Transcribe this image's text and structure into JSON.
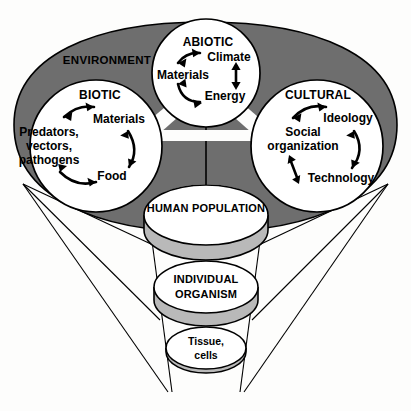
{
  "diagram": {
    "environment_label": "ENVIRONMENT",
    "colors": {
      "ring_fill": "#6e6e6e",
      "circle_fill": "#ffffff",
      "cylinder_top_fill": "#ffffff",
      "cylinder_body_fill": "#b9b9b9",
      "outline": "#000000",
      "background": "#ffffff"
    },
    "sectors": [
      {
        "id": "biotic",
        "title": "BIOTIC",
        "nodes": [
          {
            "id": "biotic-predators",
            "label_line1": "Predators,",
            "label_line2": "vectors,",
            "label_line3": "pathogens"
          },
          {
            "id": "biotic-materials",
            "label_line1": "Materials"
          },
          {
            "id": "biotic-food",
            "label_line1": "Food"
          }
        ],
        "arrows": [
          {
            "from": "biotic-predators",
            "to": "biotic-materials",
            "style": "double-headed-curved"
          },
          {
            "from": "biotic-materials",
            "to": "biotic-food",
            "style": "double-headed-curved"
          },
          {
            "from": "biotic-food",
            "to": "biotic-predators",
            "style": "double-headed-curved"
          }
        ]
      },
      {
        "id": "abiotic",
        "title": "ABIOTIC",
        "nodes": [
          {
            "id": "abiotic-materials",
            "label_line1": "Materials"
          },
          {
            "id": "abiotic-climate",
            "label_line1": "Climate"
          },
          {
            "id": "abiotic-energy",
            "label_line1": "Energy"
          }
        ],
        "arrows": [
          {
            "from": "abiotic-materials",
            "to": "abiotic-climate",
            "style": "double-headed-curved"
          },
          {
            "from": "abiotic-climate",
            "to": "abiotic-energy",
            "style": "double-headed-straight"
          },
          {
            "from": "abiotic-energy",
            "to": "abiotic-materials",
            "style": "double-headed-curved"
          }
        ]
      },
      {
        "id": "cultural",
        "title": "CULTURAL",
        "nodes": [
          {
            "id": "cultural-social",
            "label_line1": "Social",
            "label_line2": "organization"
          },
          {
            "id": "cultural-ideology",
            "label_line1": "Ideology"
          },
          {
            "id": "cultural-technology",
            "label_line1": "Technology"
          }
        ],
        "arrows": [
          {
            "from": "cultural-social",
            "to": "cultural-ideology",
            "style": "double-headed-curved"
          },
          {
            "from": "cultural-ideology",
            "to": "cultural-technology",
            "style": "double-headed-curved"
          },
          {
            "from": "cultural-technology",
            "to": "cultural-social",
            "style": "double-headed-curved"
          }
        ]
      }
    ],
    "levels": [
      {
        "id": "human-population",
        "label_line1": "HUMAN POPULATION",
        "label_line2": ""
      },
      {
        "id": "individual-organism",
        "label_line1": "INDIVIDUAL",
        "label_line2": "ORGANISM"
      },
      {
        "id": "tissue-cells",
        "label_line1": "Tissue,",
        "label_line2": "cells"
      }
    ]
  }
}
